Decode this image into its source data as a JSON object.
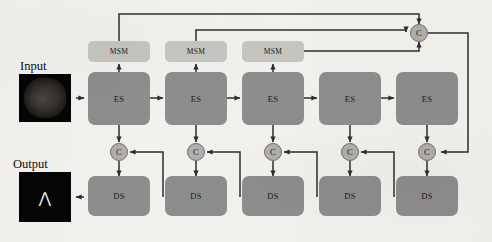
{
  "figure": {
    "type": "neural-network-architecture-diagram",
    "background_color": "#f2f1ee",
    "colors": {
      "encoder_decoder_block": "#8d8d8d",
      "msm_block": "#c6c5c0",
      "concat_circle": "#b0afab",
      "arrow": "#2e2e2e",
      "image_background": "#050505"
    }
  },
  "io": {
    "input_label": "Input",
    "output_label": "Output",
    "input_image_name": "brain-mri-slice",
    "output_image_name": "segmentation-mask",
    "output_mask_glyph": "⋀"
  },
  "encoder_stages": [
    {
      "label": "ES"
    },
    {
      "label": "ES"
    },
    {
      "label": "ES"
    },
    {
      "label": "ES"
    },
    {
      "label": "ES"
    }
  ],
  "msm_modules": [
    {
      "label": "MSM"
    },
    {
      "label": "MSM"
    },
    {
      "label": "MSM"
    }
  ],
  "decoder_stages": [
    {
      "label": "DS"
    },
    {
      "label": "DS"
    },
    {
      "label": "DS"
    },
    {
      "label": "DS"
    },
    {
      "label": "DS"
    }
  ],
  "concat_nodes": [
    {
      "label": "C",
      "position": "top-right"
    },
    {
      "label": "C",
      "position": "decoder-1"
    },
    {
      "label": "C",
      "position": "decoder-2"
    },
    {
      "label": "C",
      "position": "decoder-3"
    },
    {
      "label": "C",
      "position": "decoder-4"
    },
    {
      "label": "C",
      "position": "decoder-5"
    }
  ]
}
